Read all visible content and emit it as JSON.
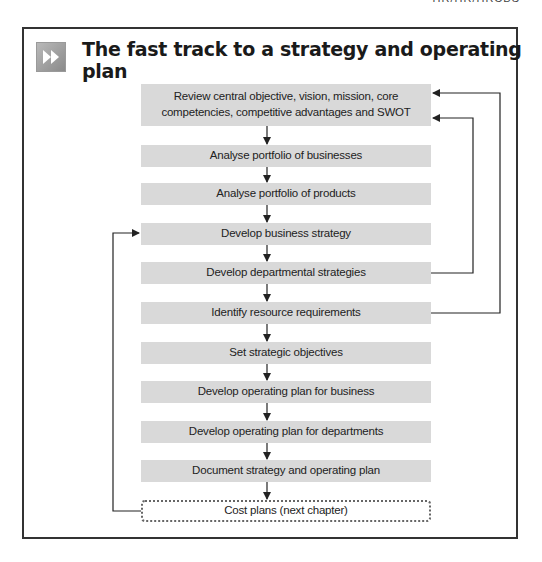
{
  "running_head": "HR/HR/HRCBS",
  "panel": {
    "icon": "fast-forward-icon",
    "title": "The fast track to a strategy and operating plan"
  },
  "steps": [
    {
      "label": "Review central objective, vision, mission, core competencies, competitive advantages and SWOT"
    },
    {
      "label": "Analyse portfolio of businesses"
    },
    {
      "label": "Analyse portfolio of products"
    },
    {
      "label": "Develop business strategy"
    },
    {
      "label": "Develop departmental strategies"
    },
    {
      "label": "Identify resource requirements"
    },
    {
      "label": "Set strategic objectives"
    },
    {
      "label": "Develop operating plan for business"
    },
    {
      "label": "Develop operating plan for departments"
    },
    {
      "label": "Document strategy and operating plan"
    },
    {
      "label": "Cost plans (next chapter)",
      "style": "dotted"
    }
  ],
  "feedback_loops": [
    {
      "from": "Develop departmental strategies",
      "to": "Review central objective, vision, mission, core competencies, competitive advantages and SWOT"
    },
    {
      "from": "Identify resource requirements",
      "to": "Review central objective, vision, mission, core competencies, competitive advantages and SWOT"
    },
    {
      "from": "Cost plans (next chapter)",
      "to": "Develop business strategy"
    }
  ],
  "colors": {
    "box_fill": "#d9d9d9",
    "line": "#333333",
    "frame": "#333333"
  }
}
